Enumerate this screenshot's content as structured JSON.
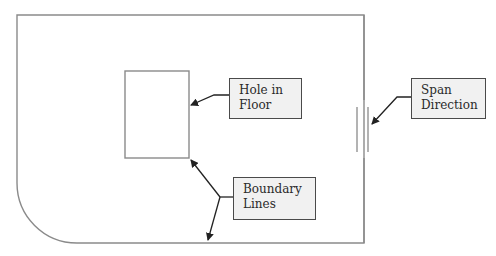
{
  "diagram": {
    "colors": {
      "line": "#8a8a8a",
      "arrow": "#222222",
      "callout_fill": "#f1f1f1",
      "callout_border": "#4a4a4a",
      "text": "#2a2a2a"
    },
    "callouts": {
      "hole": {
        "label": "Hole in\nFloor"
      },
      "span": {
        "label": "Span\nDirection"
      },
      "boundary": {
        "label": "Boundary\nLines"
      }
    },
    "shapes": [
      {
        "id": "floor-boundary",
        "type": "rect-rounded-bottom-left",
        "x": 17,
        "y": 15,
        "w": 347,
        "h": 228,
        "radius": 60
      },
      {
        "id": "hole-in-floor",
        "type": "rect",
        "x": 125,
        "y": 71,
        "w": 64,
        "h": 87
      },
      {
        "id": "span-direction-symbol",
        "type": "triple-vertical-lines",
        "xs": [
          357,
          364,
          368
        ],
        "y1": 107,
        "y2": 152
      }
    ]
  }
}
